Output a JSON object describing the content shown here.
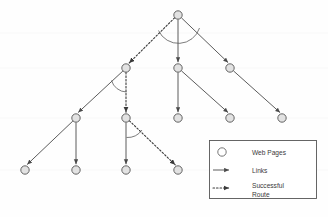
{
  "figure": {
    "background_color": "#fefefe",
    "line_color": "#4a4a4a",
    "node_stroke": "#555555",
    "node_fill": "#e2e2e2",
    "legend_border": "#555555",
    "legend_fill": "#ffffff",
    "text_color": "#3a3a3a"
  },
  "legend": {
    "items": [
      {
        "key": "web-pages",
        "label": "Web Pages",
        "symbol": "circle"
      },
      {
        "key": "links",
        "label": "Links",
        "symbol": "solid-arrow"
      },
      {
        "key": "successful-route",
        "label_line1": "Successful",
        "label_line2": "Route",
        "symbol": "dotted-arrow"
      }
    ]
  },
  "graph": {
    "node_radius": 4.2,
    "nodes": [
      {
        "id": "n0",
        "name": "root",
        "level": 0,
        "x": 178,
        "y": 15
      },
      {
        "id": "n1",
        "name": "l1-left",
        "level": 1,
        "x": 126,
        "y": 68
      },
      {
        "id": "n2",
        "name": "l1-mid",
        "level": 1,
        "x": 178,
        "y": 68
      },
      {
        "id": "n3",
        "name": "l1-right",
        "level": 1,
        "x": 230,
        "y": 68
      },
      {
        "id": "n4",
        "name": "l2-a",
        "level": 2,
        "x": 76,
        "y": 118
      },
      {
        "id": "n5",
        "name": "l2-b",
        "level": 2,
        "x": 126,
        "y": 118
      },
      {
        "id": "n6",
        "name": "l2-c",
        "level": 2,
        "x": 178,
        "y": 118
      },
      {
        "id": "n7",
        "name": "l2-d",
        "level": 2,
        "x": 230,
        "y": 118
      },
      {
        "id": "n8",
        "name": "l2-e",
        "level": 2,
        "x": 282,
        "y": 118
      },
      {
        "id": "n9",
        "name": "l3-a",
        "level": 3,
        "x": 25,
        "y": 170
      },
      {
        "id": "n10",
        "name": "l3-b",
        "level": 3,
        "x": 76,
        "y": 170
      },
      {
        "id": "n11",
        "name": "l3-c",
        "level": 3,
        "x": 126,
        "y": 170
      },
      {
        "id": "n12",
        "name": "l3-d",
        "level": 3,
        "x": 178,
        "y": 170
      }
    ],
    "links": [
      {
        "from": "n0",
        "to": "n2",
        "type": "link"
      },
      {
        "from": "n0",
        "to": "n3",
        "type": "link"
      },
      {
        "from": "n1",
        "to": "n4",
        "type": "link"
      },
      {
        "from": "n2",
        "to": "n6",
        "type": "link"
      },
      {
        "from": "n2",
        "to": "n7",
        "type": "link"
      },
      {
        "from": "n3",
        "to": "n8",
        "type": "link"
      },
      {
        "from": "n4",
        "to": "n9",
        "type": "link"
      },
      {
        "from": "n4",
        "to": "n10",
        "type": "link"
      },
      {
        "from": "n5",
        "to": "n11",
        "type": "link"
      }
    ],
    "route": [
      {
        "from": "n0",
        "to": "n1",
        "type": "route"
      },
      {
        "from": "n1",
        "to": "n5",
        "type": "route"
      },
      {
        "from": "n5",
        "to": "n12",
        "type": "route"
      }
    ],
    "angle_arcs": [
      {
        "at": "n0",
        "name": "angle-arc-root"
      },
      {
        "at": "n1",
        "name": "angle-arc-l1-left"
      },
      {
        "at": "n5",
        "name": "angle-arc-l2-b"
      }
    ]
  }
}
